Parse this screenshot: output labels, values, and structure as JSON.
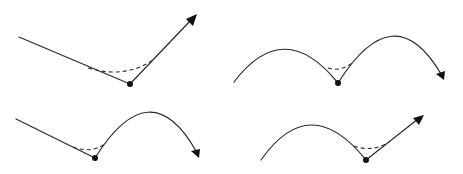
{
  "diagram": {
    "title": "",
    "colors": {
      "stroke": "#2a2a2a",
      "dot": "#111111",
      "background": "#ffffff"
    },
    "panels": [
      {
        "id": "top-left",
        "incoming": "straight-line",
        "outgoing": "straight-line-arrow",
        "vertex": [
          130,
          84
        ]
      },
      {
        "id": "top-right",
        "incoming": "arc",
        "outgoing": "arc-arrow",
        "vertex": [
          338,
          83
        ]
      },
      {
        "id": "bottom-left",
        "incoming": "straight-line",
        "outgoing": "arc-arrow",
        "vertex": [
          95,
          158
        ]
      },
      {
        "id": "bottom-right",
        "incoming": "arc",
        "outgoing": "straight-line-arrow",
        "vertex": [
          366,
          160
        ]
      }
    ]
  }
}
